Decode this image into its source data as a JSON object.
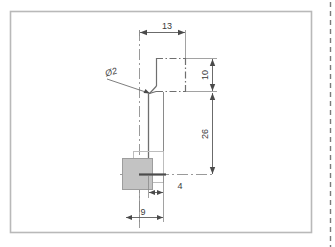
{
  "drawing": {
    "title": "Technical Part Drawing",
    "background_color": "#ffffff",
    "frame": {
      "name": "drawing-frame",
      "color": "#b9b9b9",
      "x": 10,
      "y": 11,
      "width": 302,
      "height": 222
    },
    "right_edge_marker": {
      "name": "right-edge-dashed-line",
      "color": "#777777",
      "x": 330,
      "y_start": 2,
      "y_end": 247
    },
    "colors": {
      "outline": "#6f6f6f",
      "dimension": "#5a5a5a",
      "centerline": "#8a8a8a",
      "hatch_fill": "#c2c2c2",
      "hatch_stroke": "#9a9a9a",
      "ghost_outline": "#bdbdbd",
      "text": "#3a3a3a",
      "frame": "#b9b9b9"
    },
    "dimensions": [
      {
        "name": "dim-13-top",
        "label": "13",
        "value": 13,
        "orientation": "horizontal",
        "text_x": 168,
        "text_y": 28
      },
      {
        "name": "dim-10-right",
        "label": "10",
        "value": 10,
        "orientation": "vertical",
        "text_x": 207,
        "text_y": 76
      },
      {
        "name": "dim-26-right",
        "label": "26",
        "value": 26,
        "orientation": "vertical",
        "text_x": 207,
        "text_y": 135
      },
      {
        "name": "dim-4-bottom",
        "label": "4",
        "value": 4,
        "orientation": "horizontal",
        "text_x": 180,
        "text_y": 188
      },
      {
        "name": "dim-9-bottom",
        "label": "9",
        "value": 9,
        "orientation": "horizontal",
        "text_x": 143,
        "text_y": 215
      }
    ],
    "annotations": [
      {
        "name": "diameter-callout",
        "label": "Ø2",
        "value": 2,
        "symbol": "diameter",
        "text_x": 112,
        "text_y": 74
      }
    ],
    "features": {
      "hatched_block": {
        "name": "hatched-section-block",
        "x": 122,
        "y": 158,
        "width": 30,
        "height": 31
      },
      "ghost_block": {
        "name": "ghost-outline-block",
        "x": 133,
        "y": 151,
        "width": 30,
        "height": 31
      },
      "top_profile_rect": {
        "name": "profile-top-rectangle",
        "x": 156,
        "y": 58,
        "width": 30,
        "height": 34
      },
      "shaft_line": {
        "name": "profile-shaft-line",
        "x": 148,
        "y_start": 95,
        "y_end": 176
      }
    }
  }
}
